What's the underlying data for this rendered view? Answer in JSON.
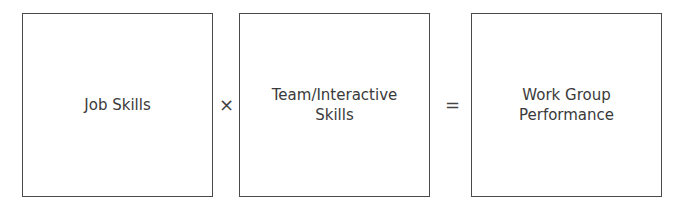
{
  "diagram": {
    "boxes": [
      {
        "lines": [
          "Job Skills"
        ]
      },
      {
        "lines": [
          "Team/Interactive",
          "Skills"
        ]
      },
      {
        "lines": [
          "Work Group",
          "Performance"
        ]
      }
    ],
    "operators": [
      "×",
      "="
    ]
  }
}
